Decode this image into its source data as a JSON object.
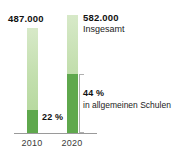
{
  "chart_data": {
    "type": "bar",
    "title": "",
    "xlabel": "",
    "ylabel": "",
    "categories": [
      "2010",
      "2020"
    ],
    "series": [
      {
        "name": "Insgesamt",
        "values": [
          487000,
          582000
        ],
        "value_labels": [
          "487.000",
          "582.000"
        ]
      },
      {
        "name": "in allgemeinen Schulen",
        "values": [
          22,
          44
        ],
        "value_labels": [
          "22 %",
          "44 %"
        ],
        "unit": "percent"
      }
    ],
    "annotations": {
      "total_label": "Insgesamt",
      "share_label": "in allgemeinen Schulen"
    },
    "grid": false,
    "legend": "none",
    "colors": {
      "light_green": "#c3dfae",
      "dark_green": "#5fa84d",
      "axis": "#9a9a9a",
      "bracket": "#b0b0b0",
      "text": "#111111"
    }
  },
  "labels": {
    "value_2010": "487.000",
    "value_2020": "582.000",
    "total_caption": "Insgesamt",
    "pct_2010": "22 %",
    "pct_2020": "44 %",
    "pct_caption": "in allgemeinen Schulen",
    "tick_2010": "2010",
    "tick_2020": "2020"
  }
}
